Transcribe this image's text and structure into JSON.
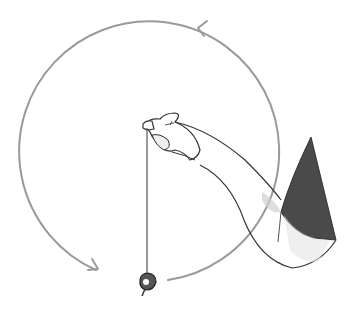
{
  "illustration": {
    "subject": "Hand holding a pendulum on a string, with a circular counterclockwise motion path",
    "colors": {
      "background": "#ffffff",
      "outline": "#333333",
      "motion_path": "#9a9a9a",
      "sleeve": "#4a4a4a",
      "shading": "#cfcfcf"
    },
    "motion": {
      "direction": "counterclockwise",
      "arrow_count": 2
    }
  }
}
